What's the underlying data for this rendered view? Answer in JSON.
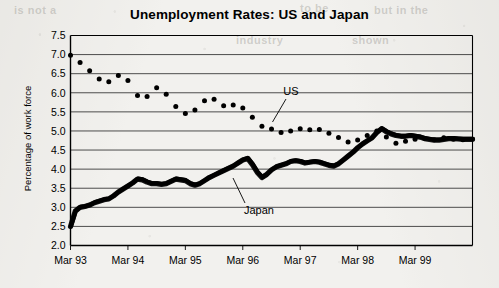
{
  "chart_data": {
    "type": "line",
    "title": "Unemployment Rates: US and Japan",
    "xlabel": "",
    "ylabel": "Percentage of work force",
    "ylim": [
      2.0,
      7.5
    ],
    "ytick_step": 0.5,
    "yticks": [
      "7.5",
      "7.0",
      "6.5",
      "6.0",
      "5.5",
      "5.0",
      "4.5",
      "4.0",
      "3.5",
      "3.0",
      "2.5",
      "2.0"
    ],
    "xticks": [
      "Mar 93",
      "Mar 94",
      "Mar 95",
      "Mar 96",
      "Mar 97",
      "Mar 98",
      "Mar 99"
    ],
    "xlim_months": [
      0,
      84
    ],
    "grid": "horizontal",
    "legend": "inline-annotations",
    "annotations": [
      {
        "text": "US",
        "points_to_series": "US"
      },
      {
        "text": "Japan",
        "points_to_series": "Japan"
      }
    ],
    "series": [
      {
        "name": "US",
        "marker": "dot",
        "style": "scatter",
        "color": "#000000",
        "x": [
          0,
          2,
          4,
          6,
          8,
          10,
          12,
          14,
          16,
          18,
          20,
          22,
          24,
          26,
          28,
          30,
          32,
          34,
          36,
          38,
          40,
          42,
          44,
          46,
          48,
          50,
          52,
          54,
          56,
          58,
          60,
          62,
          64,
          66,
          68,
          70,
          72,
          74,
          76,
          78,
          80,
          82
        ],
        "values": [
          6.98,
          6.79,
          6.58,
          6.36,
          6.29,
          6.45,
          6.32,
          5.93,
          5.9,
          6.13,
          5.96,
          5.64,
          5.46,
          5.55,
          5.79,
          5.83,
          5.66,
          5.68,
          5.6,
          5.36,
          5.12,
          5.05,
          4.96,
          5.0,
          5.06,
          5.03,
          5.04,
          4.94,
          4.83,
          4.71,
          4.76,
          4.88,
          5.0,
          4.84,
          4.68,
          4.73,
          4.78,
          4.8,
          4.77,
          4.82,
          4.78,
          4.77
        ]
      },
      {
        "name": "Japan",
        "marker": "none",
        "style": "thick-line",
        "color": "#000000",
        "x": [
          0,
          1,
          2,
          3,
          4,
          5,
          6,
          7,
          8,
          9,
          10,
          11,
          12,
          13,
          14,
          15,
          16,
          17,
          18,
          19,
          20,
          21,
          22,
          23,
          24,
          25,
          26,
          27,
          28,
          29,
          30,
          31,
          32,
          33,
          34,
          35,
          36,
          37,
          38,
          39,
          40,
          41,
          42,
          43,
          44,
          45,
          46,
          47,
          48,
          49,
          50,
          51,
          52,
          53,
          54,
          55,
          56,
          57,
          58,
          59,
          60,
          61,
          62,
          63,
          64,
          65,
          66,
          67,
          68,
          69,
          70,
          71,
          72,
          73,
          74,
          75,
          76,
          77,
          78,
          79,
          80,
          81,
          82,
          83,
          84
        ],
        "values": [
          2.5,
          2.9,
          3.0,
          3.02,
          3.06,
          3.12,
          3.16,
          3.2,
          3.22,
          3.3,
          3.4,
          3.48,
          3.56,
          3.64,
          3.74,
          3.72,
          3.66,
          3.62,
          3.62,
          3.6,
          3.62,
          3.68,
          3.74,
          3.72,
          3.7,
          3.62,
          3.58,
          3.62,
          3.7,
          3.78,
          3.84,
          3.9,
          3.96,
          4.02,
          4.08,
          4.16,
          4.24,
          4.28,
          4.12,
          3.92,
          3.78,
          3.86,
          3.98,
          4.06,
          4.1,
          4.14,
          4.2,
          4.22,
          4.2,
          4.16,
          4.18,
          4.2,
          4.18,
          4.14,
          4.1,
          4.08,
          4.14,
          4.24,
          4.34,
          4.44,
          4.56,
          4.66,
          4.74,
          4.82,
          4.96,
          5.06,
          4.98,
          4.92,
          4.88,
          4.86,
          4.86,
          4.88,
          4.86,
          4.84,
          4.8,
          4.78,
          4.76,
          4.76,
          4.78,
          4.8,
          4.8,
          4.79,
          4.78,
          4.78,
          4.78
        ]
      }
    ]
  },
  "bleed_text": [
    {
      "text": "is not a",
      "x": 14,
      "y": 4,
      "size": 11
    },
    {
      "text": "to be",
      "x": 300,
      "y": 2,
      "size": 11
    },
    {
      "text": "but in the",
      "x": 374,
      "y": 4,
      "size": 11
    },
    {
      "text": "industry",
      "x": 236,
      "y": 34,
      "size": 11
    },
    {
      "text": "shown",
      "x": 352,
      "y": 34,
      "size": 11
    }
  ],
  "colors": {
    "ink": "#000000",
    "grid": "#3a3a3a",
    "paper": "#f2f1ee"
  }
}
